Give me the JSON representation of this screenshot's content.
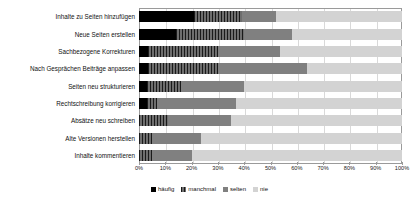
{
  "chart_data": {
    "type": "bar",
    "orientation": "horizontal",
    "stacked": true,
    "normalized_percent": true,
    "title": "",
    "xlabel": "",
    "ylabel": "",
    "xlim": [
      0,
      100
    ],
    "grid": true,
    "legend_position": "bottom",
    "x_tick_labels": [
      "0%",
      "10%",
      "20%",
      "30%",
      "40%",
      "50%",
      "60%",
      "70%",
      "80%",
      "90%",
      "100%"
    ],
    "x_tick_values": [
      0,
      10,
      20,
      30,
      40,
      50,
      60,
      70,
      80,
      90,
      100
    ],
    "categories": [
      "Inhalte zu Seiten hinzufügen",
      "Neue Seiten erstellen",
      "Sachbezogene Korrekturen",
      "Nach Gesprächen Beiträge anpassen",
      "Seiten neu strukturieren",
      "Rechtschreibung korrigieren",
      "Absätze neu schreiben",
      "Alte Versionen herstellen",
      "Inhalte kommentieren"
    ],
    "series": [
      {
        "name": "häufig",
        "color": "#000000",
        "values": [
          21,
          14,
          3.5,
          3.5,
          3,
          3,
          0,
          0,
          0
        ]
      },
      {
        "name": "manchmal",
        "color": "#4d4d4d",
        "values": [
          18,
          26,
          26.5,
          26.5,
          13,
          4,
          11,
          5,
          5
        ]
      },
      {
        "name": "selten",
        "color": "#808080",
        "values": [
          13,
          18,
          23.5,
          34,
          24,
          30,
          24,
          18.5,
          15
        ]
      },
      {
        "name": "nie",
        "color": "#d3d3d3",
        "values": [
          48,
          42,
          46.5,
          36,
          60,
          63,
          65,
          76.5,
          80
        ]
      }
    ]
  },
  "legend": {
    "items": [
      {
        "label": "häufig",
        "color": "#000000"
      },
      {
        "label": "manchmal",
        "color": "#4d4d4d"
      },
      {
        "label": "selten",
        "color": "#808080"
      },
      {
        "label": "nie",
        "color": "#d3d3d3"
      }
    ]
  }
}
